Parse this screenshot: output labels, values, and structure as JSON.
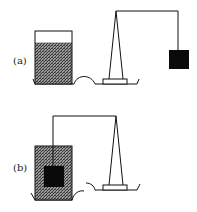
{
  "figure": {
    "panels": [
      {
        "label": "(a)",
        "description": "Beaker of liquid sits on the balance's left side on its own; the block hangs freely in air from the beam",
        "beaker": {
          "fill_level": "partial"
        },
        "block": {
          "position": "hanging in air"
        }
      },
      {
        "label": "(b)",
        "description": "The block is suspended from the beam and fully submerged in the beaker of liquid",
        "beaker": {
          "fill_level": "full"
        },
        "block": {
          "position": "submerged in liquid"
        }
      }
    ],
    "colors": {
      "line": "#111111",
      "liquid": "#6e6e6e",
      "block": "#0a0a0a",
      "background": "#ffffff"
    }
  }
}
